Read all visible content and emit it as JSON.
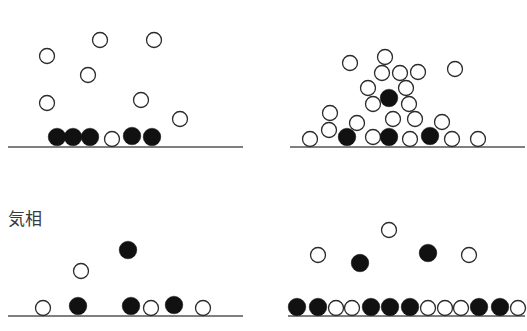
{
  "figure": {
    "top_cropped_label": "",
    "panels": [
      {
        "id": "top-left",
        "label": "",
        "baseline": {
          "x1": 8,
          "x2": 243,
          "y": 147
        },
        "particles": [
          {
            "x": 47,
            "y": 56,
            "filled": false
          },
          {
            "x": 100,
            "y": 40,
            "filled": false
          },
          {
            "x": 154,
            "y": 40,
            "filled": false
          },
          {
            "x": 88,
            "y": 75,
            "filled": false
          },
          {
            "x": 47,
            "y": 103,
            "filled": false
          },
          {
            "x": 141,
            "y": 100,
            "filled": false
          },
          {
            "x": 180,
            "y": 119,
            "filled": false
          },
          {
            "x": 57,
            "y": 137,
            "filled": true
          },
          {
            "x": 73,
            "y": 137,
            "filled": true
          },
          {
            "x": 90,
            "y": 137,
            "filled": true
          },
          {
            "x": 112,
            "y": 139,
            "filled": false
          },
          {
            "x": 132,
            "y": 136,
            "filled": true
          },
          {
            "x": 152,
            "y": 137,
            "filled": true
          }
        ]
      },
      {
        "id": "top-right",
        "label": "",
        "baseline": {
          "x1": 290,
          "x2": 525,
          "y": 147
        },
        "particles": [
          {
            "x": 385,
            "y": 57,
            "filled": false
          },
          {
            "x": 350,
            "y": 63,
            "filled": false
          },
          {
            "x": 382,
            "y": 73,
            "filled": false
          },
          {
            "x": 400,
            "y": 73,
            "filled": false
          },
          {
            "x": 418,
            "y": 72,
            "filled": false
          },
          {
            "x": 455,
            "y": 69,
            "filled": false
          },
          {
            "x": 368,
            "y": 88,
            "filled": false
          },
          {
            "x": 406,
            "y": 88,
            "filled": false
          },
          {
            "x": 389,
            "y": 98,
            "filled": true
          },
          {
            "x": 373,
            "y": 104,
            "filled": false
          },
          {
            "x": 409,
            "y": 104,
            "filled": false
          },
          {
            "x": 330,
            "y": 113,
            "filled": false
          },
          {
            "x": 393,
            "y": 119,
            "filled": false
          },
          {
            "x": 415,
            "y": 119,
            "filled": false
          },
          {
            "x": 442,
            "y": 122,
            "filled": false
          },
          {
            "x": 329,
            "y": 130,
            "filled": false
          },
          {
            "x": 357,
            "y": 123,
            "filled": false
          },
          {
            "x": 310,
            "y": 139,
            "filled": false
          },
          {
            "x": 347,
            "y": 137,
            "filled": true
          },
          {
            "x": 373,
            "y": 137,
            "filled": false
          },
          {
            "x": 389,
            "y": 137,
            "filled": true
          },
          {
            "x": 410,
            "y": 139,
            "filled": false
          },
          {
            "x": 430,
            "y": 136,
            "filled": true
          },
          {
            "x": 452,
            "y": 139,
            "filled": false
          },
          {
            "x": 478,
            "y": 139,
            "filled": false
          }
        ]
      },
      {
        "id": "bottom-left",
        "label": "気相",
        "label_pos": {
          "x": 8,
          "y": 205
        },
        "baseline": {
          "x1": 8,
          "x2": 243,
          "y": 316
        },
        "particles": [
          {
            "x": 128,
            "y": 250,
            "filled": true
          },
          {
            "x": 81,
            "y": 271,
            "filled": false
          },
          {
            "x": 43,
            "y": 308,
            "filled": false
          },
          {
            "x": 78,
            "y": 306,
            "filled": true
          },
          {
            "x": 131,
            "y": 306,
            "filled": true
          },
          {
            "x": 151,
            "y": 308,
            "filled": false
          },
          {
            "x": 174,
            "y": 305,
            "filled": true
          },
          {
            "x": 203,
            "y": 308,
            "filled": false
          }
        ]
      },
      {
        "id": "bottom-right",
        "label": "",
        "baseline": {
          "x1": 288,
          "x2": 525,
          "y": 316
        },
        "particles": [
          {
            "x": 389,
            "y": 230,
            "filled": false
          },
          {
            "x": 318,
            "y": 255,
            "filled": false
          },
          {
            "x": 360,
            "y": 263,
            "filled": true
          },
          {
            "x": 428,
            "y": 253,
            "filled": true
          },
          {
            "x": 469,
            "y": 255,
            "filled": false
          },
          {
            "x": 297,
            "y": 307,
            "filled": true
          },
          {
            "x": 318,
            "y": 307,
            "filled": true
          },
          {
            "x": 336,
            "y": 308,
            "filled": false
          },
          {
            "x": 352,
            "y": 308,
            "filled": false
          },
          {
            "x": 371,
            "y": 307,
            "filled": true
          },
          {
            "x": 390,
            "y": 307,
            "filled": true
          },
          {
            "x": 410,
            "y": 307,
            "filled": true
          },
          {
            "x": 428,
            "y": 308,
            "filled": false
          },
          {
            "x": 445,
            "y": 308,
            "filled": false
          },
          {
            "x": 461,
            "y": 308,
            "filled": false
          },
          {
            "x": 479,
            "y": 307,
            "filled": true
          },
          {
            "x": 500,
            "y": 307,
            "filled": true
          },
          {
            "x": 518,
            "y": 308,
            "filled": false
          }
        ]
      }
    ],
    "style": {
      "particle_radius_open": 7.5,
      "particle_radius_filled": 8.8,
      "stroke_color": "#2b2b2b",
      "fill_color": "#111111",
      "line_color": "#555555"
    }
  }
}
